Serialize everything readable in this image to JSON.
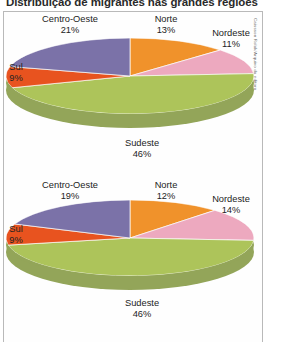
{
  "figure": {
    "title": "Distribuição de migrantes nas grandes regiões",
    "credit": "Caissson Rolak/Arquivo da editora"
  },
  "chart_data": [
    {
      "type": "pie",
      "title": "Distribuição de migrantes nas grandes regiões",
      "categories": [
        "Norte",
        "Nordeste",
        "Sudeste",
        "Sul",
        "Centro-Oeste"
      ],
      "values": [
        13,
        11,
        46,
        9,
        21
      ],
      "value_suffix": "%",
      "colors": [
        "#f0922b",
        "#edA9bf",
        "#adc45a",
        "#e8531f",
        "#7b72a8"
      ],
      "legend": "labels-outside",
      "labels": [
        {
          "name": "Centro-Oeste",
          "value": "21%"
        },
        {
          "name": "Norte",
          "value": "13%"
        },
        {
          "name": "Nordeste",
          "value": "11%"
        },
        {
          "name": "Sul",
          "value": "9%"
        },
        {
          "name": "Sudeste",
          "value": "46%"
        }
      ]
    },
    {
      "type": "pie",
      "categories": [
        "Norte",
        "Nordeste",
        "Sudeste",
        "Sul",
        "Centro-Oeste"
      ],
      "values": [
        12,
        14,
        46,
        9,
        19
      ],
      "value_suffix": "%",
      "colors": [
        "#f0922b",
        "#edA9bf",
        "#adc45a",
        "#e8531f",
        "#7b72a8"
      ],
      "legend": "labels-outside",
      "labels": [
        {
          "name": "Centro-Oeste",
          "value": "19%"
        },
        {
          "name": "Norte",
          "value": "12%"
        },
        {
          "name": "Nordeste",
          "value": "14%"
        },
        {
          "name": "Sul",
          "value": "9%"
        },
        {
          "name": "Sudeste",
          "value": "46%"
        }
      ]
    }
  ]
}
